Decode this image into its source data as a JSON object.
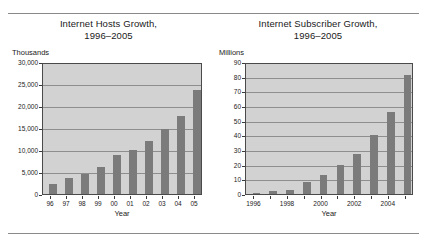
{
  "figure": {
    "rule_top": "horizontal-rule",
    "rule_bottom": "horizontal-rule"
  },
  "charts": [
    {
      "title_line1": "Internet Hosts Growth,",
      "title_line2": "1996–2005",
      "unit": "Thousands",
      "xlabel": "Year"
    },
    {
      "title_line1": "Internet Subscriber Growth,",
      "title_line2": "1996–2005",
      "unit": "Millions",
      "xlabel": "Year"
    }
  ],
  "chart_data": [
    {
      "type": "bar",
      "title": "Internet Hosts Growth, 1996–2005",
      "xlabel": "Year",
      "ylabel": "Thousands",
      "categories": [
        "96",
        "97",
        "98",
        "99",
        "00",
        "01",
        "02",
        "03",
        "04",
        "05"
      ],
      "values": [
        2300,
        3700,
        4500,
        6100,
        8900,
        9900,
        12000,
        14800,
        17800,
        23700
      ],
      "ylim": [
        0,
        30000
      ],
      "ytick_step": 5000,
      "ytick_labels": [
        "0",
        "5,000",
        "10,000",
        "15,000",
        "20,000",
        "25,000",
        "30,000"
      ],
      "grid": true,
      "legend": false,
      "bar_color": "#7b7b7b",
      "plot_background": "#d2d2d2"
    },
    {
      "type": "bar",
      "title": "Internet Subscriber Growth, 1996–2005",
      "xlabel": "Year",
      "ylabel": "Millions",
      "categories": [
        "1996",
        "1997",
        "1998",
        "1999",
        "2000",
        "2001",
        "2002",
        "2003",
        "2004",
        "2005"
      ],
      "tick_labels_shown": [
        "1996",
        "1998",
        "2000",
        "2002",
        "2004"
      ],
      "values": [
        1,
        2,
        2.5,
        8,
        13,
        19.5,
        27,
        40,
        56,
        81
      ],
      "ylim": [
        0,
        90
      ],
      "ytick_step": 10,
      "ytick_labels": [
        "0",
        "10",
        "20",
        "30",
        "40",
        "50",
        "60",
        "70",
        "80",
        "90"
      ],
      "grid": true,
      "legend": false,
      "bar_color": "#7b7b7b",
      "plot_background": "#d2d2d2"
    }
  ]
}
